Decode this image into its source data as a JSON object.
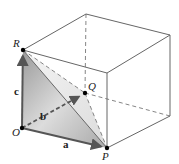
{
  "diagram": {
    "type": "cube-vectors",
    "points": {
      "R": {
        "label": "R",
        "x": 23,
        "y": 50
      },
      "O": {
        "label": "O",
        "x": 22,
        "y": 128
      },
      "P": {
        "label": "P",
        "x": 107,
        "y": 148
      },
      "Q": {
        "label": "Q",
        "x": 85,
        "y": 93
      }
    },
    "vectors": {
      "a": {
        "label": "a",
        "from": "O",
        "to": "P"
      },
      "b": {
        "label": "b",
        "from": "O",
        "to": "Q",
        "style": "dashed"
      },
      "c": {
        "label": "c",
        "from": "O",
        "to": "R"
      }
    },
    "colors": {
      "edge": "#555555",
      "vector": "#555555",
      "shade_dark": "#b5b5b5",
      "shade_light": "#e6e6e6"
    }
  }
}
